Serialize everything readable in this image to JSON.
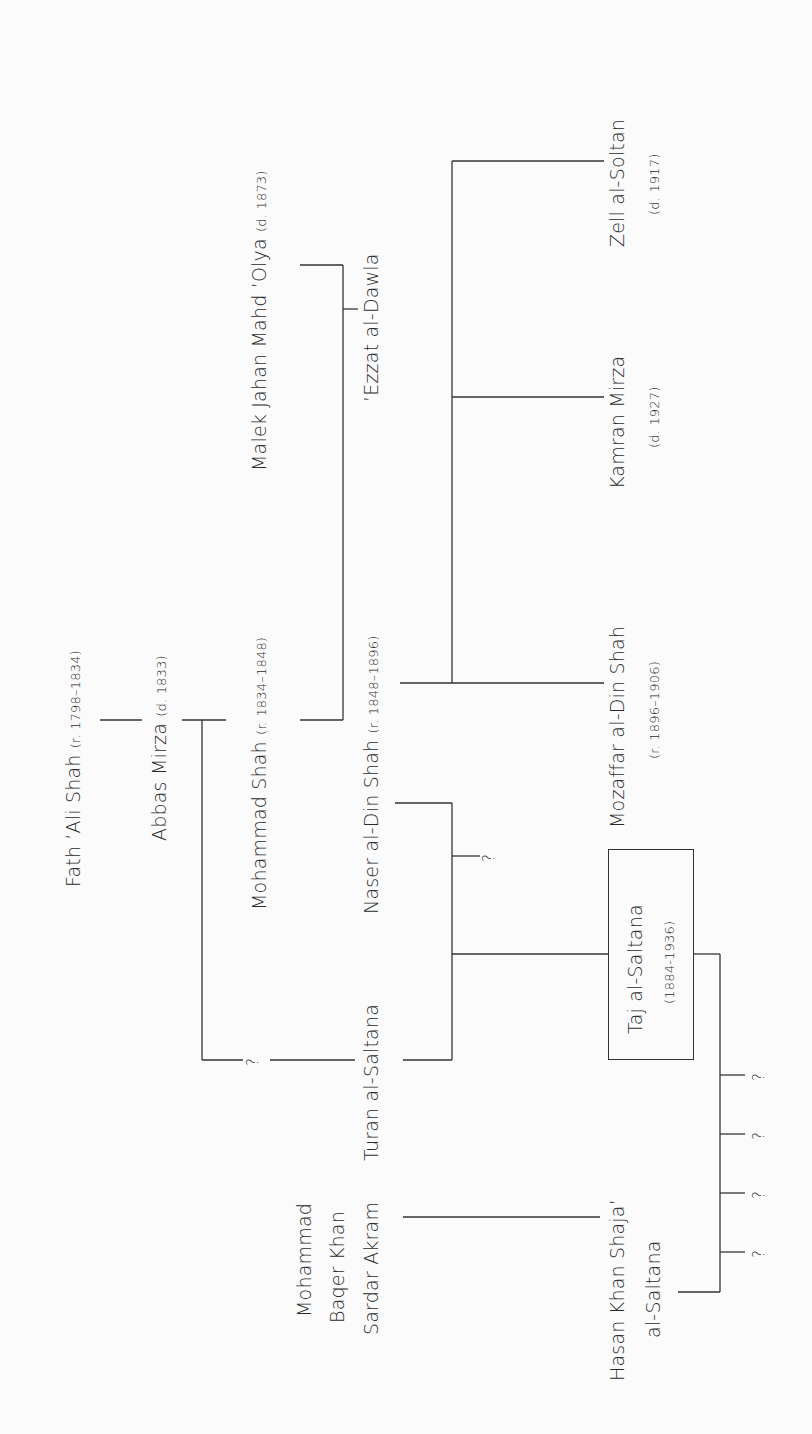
{
  "diagram": {
    "type": "genealogy",
    "orientation": "rotated-90-ccw",
    "people": {
      "fath_ali": {
        "name": "Fath ’Ali Shah",
        "dates": "(r. 1798–1834)"
      },
      "abbas": {
        "name": "Abbas Mirza",
        "dates": "(d. 1833)"
      },
      "mohammad_shah": {
        "name": "Mohammad Shah",
        "dates": "(r. 1834–1848)"
      },
      "malek_jahan": {
        "name": "Malek Jahan Mahd ’Olya",
        "dates": "(d. 1873)"
      },
      "naser": {
        "name": "Naser al-Din Shah",
        "dates": "(r. 1848–1896)"
      },
      "ezzat": {
        "name": "’Ezzat al-Dawla"
      },
      "turan": {
        "name": "Turan al-Saltana"
      },
      "mozaffar": {
        "name": "Mozaffar al-Din Shah",
        "dates": "(r. 1896–1906)"
      },
      "kamran": {
        "name": "Kamran Mirza",
        "dates": "(d. 1927)"
      },
      "zell": {
        "name": "Zell al-Soltan",
        "dates": "(d. 1917)"
      },
      "taj": {
        "name": "Taj al-Saltana",
        "dates": "(1884-1936)"
      },
      "baqer": {
        "line1": "Mohammad",
        "line2": "Baqer Khan",
        "line3": "Sardar Akram"
      },
      "hasan": {
        "line1": "Hasan Khan Shaja’",
        "line2": "al-Saltana"
      }
    },
    "unknown_mark": "?"
  }
}
